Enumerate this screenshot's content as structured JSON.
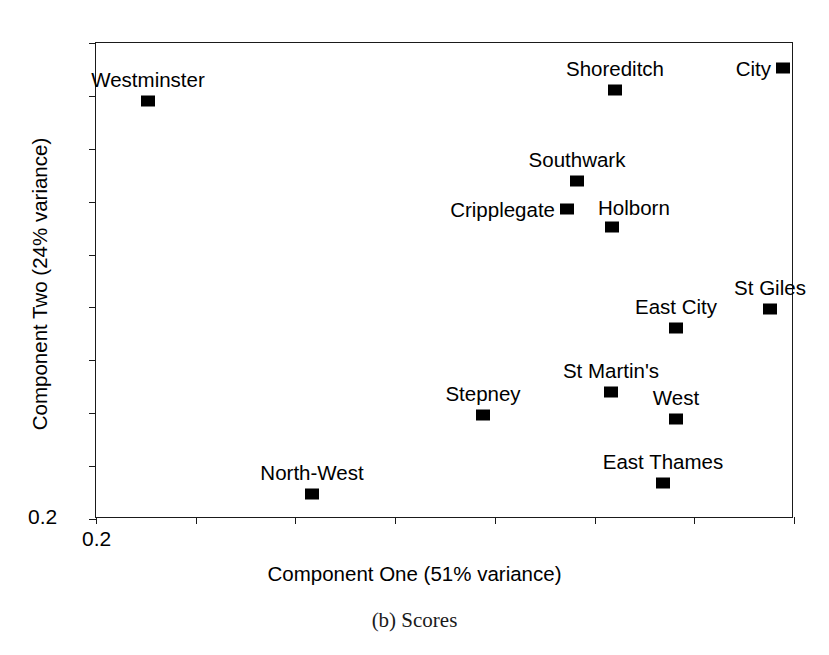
{
  "chart_data": {
    "type": "scatter",
    "title": "",
    "caption": "(b) Scores",
    "xlabel": "Component One (51% variance)",
    "ylabel": "Component Two (24% variance)",
    "x_tick_labels": [
      "0.2"
    ],
    "y_tick_labels": [
      "0.2"
    ],
    "x_axis_origin_label": "0.2",
    "y_axis_origin_label": "0.2",
    "grid": false,
    "legend": "none",
    "marker_style": "filled-square",
    "marker_color": "#000000",
    "axis_color": "#1a1a1a",
    "background_color": "#ffffff",
    "n_points": 13,
    "x_tick_count": 8,
    "y_tick_count": 10,
    "points": [
      {
        "name": "Westminster",
        "px": 148,
        "py": 101,
        "label_pos": "above"
      },
      {
        "name": "Shoreditch",
        "px": 615,
        "py": 90,
        "label_pos": "above"
      },
      {
        "name": "City",
        "px": 783,
        "py": 68,
        "label_pos": "left"
      },
      {
        "name": "Southwark",
        "px": 577,
        "py": 181,
        "label_pos": "above"
      },
      {
        "name": "Cripplegate",
        "px": 567,
        "py": 209,
        "label_pos": "left"
      },
      {
        "name": "Holborn",
        "px": 612,
        "py": 227,
        "label_pos": "above-right"
      },
      {
        "name": "St Giles",
        "px": 770,
        "py": 309,
        "label_pos": "above"
      },
      {
        "name": "East City",
        "px": 676,
        "py": 328,
        "label_pos": "above"
      },
      {
        "name": "St Martin's",
        "px": 611,
        "py": 392,
        "label_pos": "above"
      },
      {
        "name": "West",
        "px": 676,
        "py": 419,
        "label_pos": "above"
      },
      {
        "name": "Stepney",
        "px": 483,
        "py": 415,
        "label_pos": "above"
      },
      {
        "name": "North-West",
        "px": 312,
        "py": 494,
        "label_pos": "above"
      },
      {
        "name": "East Thames",
        "px": 663,
        "py": 483,
        "label_pos": "above"
      }
    ]
  }
}
